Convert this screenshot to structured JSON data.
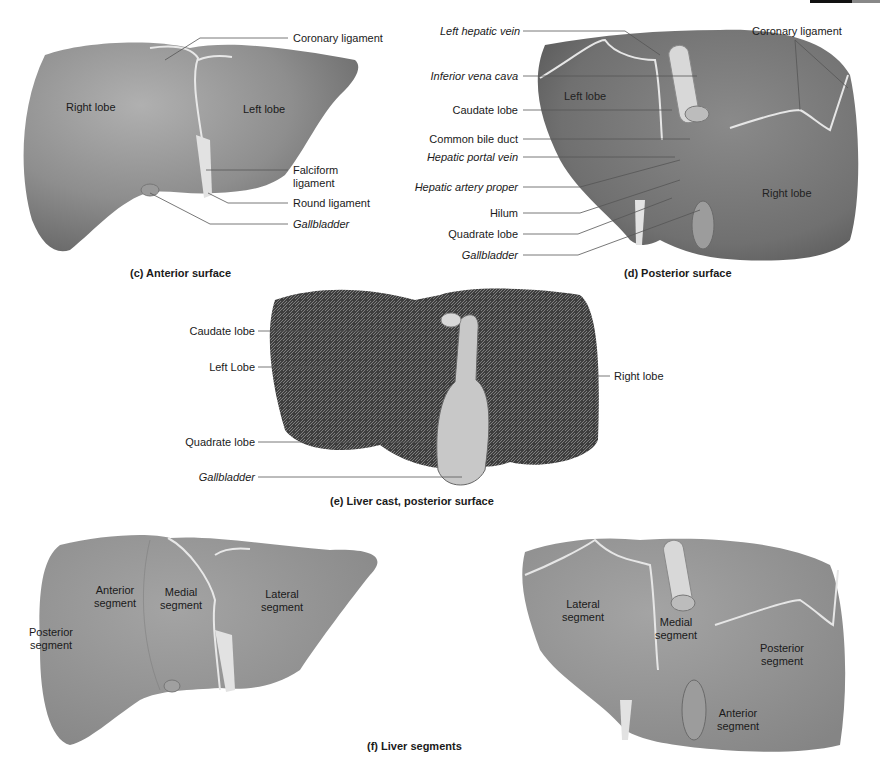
{
  "panels": {
    "c": {
      "caption": "(c) Anterior surface",
      "inner_labels": {
        "right_lobe": "Right lobe",
        "left_lobe": "Left lobe"
      },
      "callouts": [
        {
          "text": "Coronary ligament",
          "italic": false
        },
        {
          "text": "Falciform ligament",
          "italic": false
        },
        {
          "text": "Round ligament",
          "italic": false
        },
        {
          "text": "Gallbladder",
          "italic": true
        }
      ]
    },
    "d": {
      "caption": "(d) Posterior surface",
      "inner_labels": {
        "left_lobe": "Left lobe",
        "right_lobe": "Right lobe"
      },
      "callouts_left": [
        {
          "text": "Left hepatic vein",
          "italic": true
        },
        {
          "text": "Inferior vena cava",
          "italic": true
        },
        {
          "text": "Caudate lobe",
          "italic": false
        },
        {
          "text": "Common bile duct",
          "italic": false
        },
        {
          "text": "Hepatic portal vein",
          "italic": true
        },
        {
          "text": "Hepatic artery proper",
          "italic": true
        },
        {
          "text": "Hilum",
          "italic": false
        },
        {
          "text": "Quadrate lobe",
          "italic": false
        },
        {
          "text": "Gallbladder",
          "italic": true
        }
      ],
      "callout_right": {
        "text": "Coronary ligament",
        "italic": false
      }
    },
    "e": {
      "caption": "(e) Liver cast, posterior surface",
      "callouts_left": [
        {
          "text": "Caudate lobe",
          "italic": false
        },
        {
          "text": "Left Lobe",
          "italic": false
        },
        {
          "text": "Quadrate lobe",
          "italic": false
        },
        {
          "text": "Gallbladder",
          "italic": true
        }
      ],
      "callout_right": {
        "text": "Right lobe",
        "italic": false
      }
    },
    "f": {
      "caption": "(f) Liver segments",
      "anterior_view": {
        "posterior_segment": "Posterior segment",
        "anterior_segment": "Anterior segment",
        "medial_segment": "Medial segment",
        "lateral_segment": "Lateral segment"
      },
      "posterior_view": {
        "lateral_segment": "Lateral segment",
        "medial_segment": "Medial segment",
        "posterior_segment": "Posterior segment",
        "anterior_segment": "Anterior segment"
      }
    }
  },
  "colors": {
    "liver": "#8d8d8d",
    "liver_light": "#a8a8a8",
    "liver_dark": "#6e6e6e",
    "ligament": "#e6e6e6",
    "cast": "#4a4a4a",
    "leader": "#555555"
  }
}
